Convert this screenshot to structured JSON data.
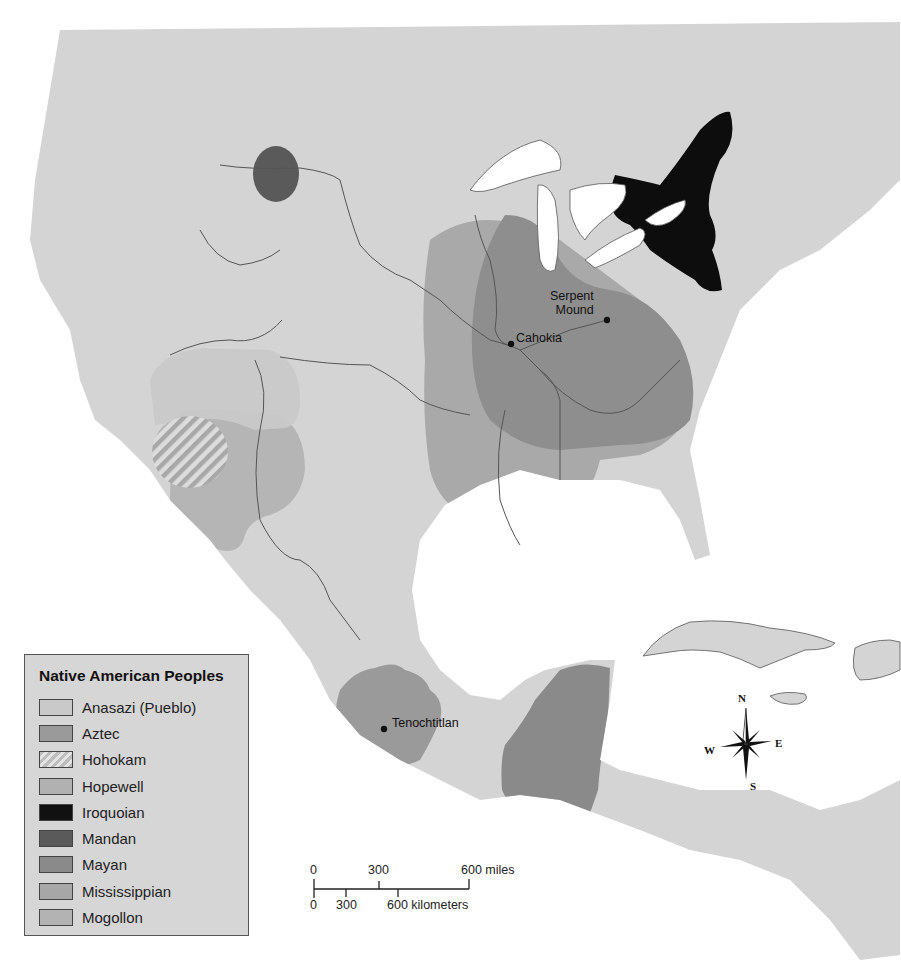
{
  "map": {
    "title": "Native American Peoples",
    "colors": {
      "ocean": "#ffffff",
      "land": "#d4d4d4",
      "border": "#555555",
      "anasazi": "#c9c9c9",
      "aztec": "#9a9a9a",
      "hohokam_hatch": "#bdbdbd",
      "hopewell": "#b1b1b1",
      "iroquoian": "#0d0d0d",
      "mandan": "#5a5a5a",
      "mayan": "#8a8a8a",
      "mississippian": "#8e8e8e",
      "mogollon": "#b3b3b3"
    },
    "sites": [
      {
        "name": "Serpent Mound",
        "line1": "Serpent",
        "line2": "Mound",
        "x": 607,
        "y": 320
      },
      {
        "name": "Cahokia",
        "label": "Cahokia",
        "x": 511,
        "y": 344
      },
      {
        "name": "Tenochtitlan",
        "label": "Tenochtitlan",
        "x": 384,
        "y": 729
      }
    ]
  },
  "legend": {
    "title": "Native American Peoples",
    "items": [
      {
        "label": "Anasazi (Pueblo)",
        "swatch": "#c9c9c9",
        "pattern": "solid"
      },
      {
        "label": "Aztec",
        "swatch": "#9a9a9a",
        "pattern": "solid"
      },
      {
        "label": "Hohokam",
        "swatch": "#bdbdbd",
        "pattern": "hatched"
      },
      {
        "label": "Hopewell",
        "swatch": "#b1b1b1",
        "pattern": "solid"
      },
      {
        "label": "Iroquoian",
        "swatch": "#111111",
        "pattern": "solid"
      },
      {
        "label": "Mandan",
        "swatch": "#5a5a5a",
        "pattern": "solid"
      },
      {
        "label": "Mayan",
        "swatch": "#8a8a8a",
        "pattern": "solid"
      },
      {
        "label": "Mississippian",
        "swatch": "#a7a7a7",
        "pattern": "solid"
      },
      {
        "label": "Mogollon",
        "swatch": "#b3b3b3",
        "pattern": "solid"
      }
    ]
  },
  "scale_bar": {
    "miles": {
      "ticks": [
        "0",
        "300"
      ],
      "end_label": "600 miles"
    },
    "kilometers": {
      "ticks": [
        "0",
        "300"
      ],
      "end_label": "600 kilometers"
    }
  },
  "compass": {
    "n": "N",
    "s": "S",
    "e": "E",
    "w": "W"
  }
}
